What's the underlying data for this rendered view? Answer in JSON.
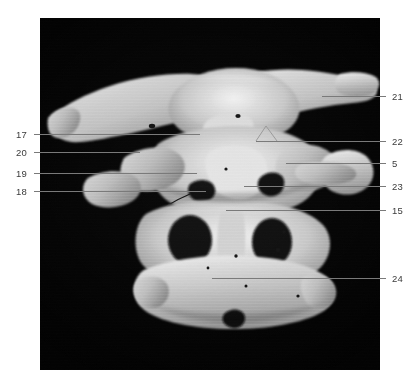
{
  "figure": {
    "kind": "anatomical-photograph",
    "background_color": "#030303",
    "page_color": "#ffffff",
    "label_color": "#3b3b3b",
    "leader_color": "#7a7a7a",
    "bone_highlight": "#ececec",
    "bone_midtone": "#b9b9b9",
    "bone_shadow": "#6f6f6f",
    "photo": {
      "x": 40,
      "y": 18,
      "width": 340,
      "height": 352
    }
  },
  "labels": {
    "left": [
      {
        "id": "17",
        "text": "17",
        "x": 16,
        "y": 130,
        "line": {
          "x1": 34,
          "y1": 134,
          "x2": 200,
          "y2": 134
        }
      },
      {
        "id": "20",
        "text": "20",
        "x": 16,
        "y": 148,
        "line": {
          "x1": 34,
          "y1": 152,
          "x2": 140,
          "y2": 152
        }
      },
      {
        "id": "19",
        "text": "19",
        "x": 16,
        "y": 169,
        "line": {
          "x1": 34,
          "y1": 173,
          "x2": 197,
          "y2": 173
        }
      },
      {
        "id": "18",
        "text": "18",
        "x": 16,
        "y": 187,
        "line": {
          "x1": 34,
          "y1": 191,
          "x2": 206,
          "y2": 191
        }
      }
    ],
    "right": [
      {
        "id": "21",
        "text": "21",
        "x": 392,
        "y": 92,
        "line": {
          "x1": 322,
          "y1": 96,
          "x2": 386,
          "y2": 96
        }
      },
      {
        "id": "22",
        "text": "22",
        "x": 392,
        "y": 137,
        "line": {
          "x1": 256,
          "y1": 141,
          "x2": 386,
          "y2": 141
        }
      },
      {
        "id": "5",
        "text": "5",
        "x": 392,
        "y": 159,
        "line": {
          "x1": 286,
          "y1": 163,
          "x2": 386,
          "y2": 163
        }
      },
      {
        "id": "23",
        "text": "23",
        "x": 392,
        "y": 182,
        "line": {
          "x1": 244,
          "y1": 186,
          "x2": 386,
          "y2": 186
        }
      },
      {
        "id": "15",
        "text": "15",
        "x": 392,
        "y": 206,
        "line": {
          "x1": 226,
          "y1": 210,
          "x2": 386,
          "y2": 210
        }
      },
      {
        "id": "24",
        "text": "24",
        "x": 392,
        "y": 274,
        "line": {
          "x1": 212,
          "y1": 278,
          "x2": 386,
          "y2": 278
        }
      }
    ]
  }
}
